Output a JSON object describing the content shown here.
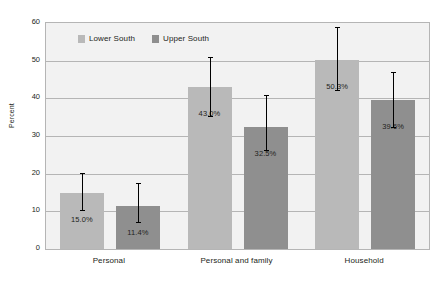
{
  "chart_data": {
    "type": "bar",
    "title": "",
    "xlabel": "",
    "ylabel": "Percent",
    "ylim": [
      0,
      60
    ],
    "yticks": [
      0,
      10,
      20,
      30,
      40,
      50,
      60
    ],
    "grid": true,
    "legend_position": "top-left-inside",
    "categories": [
      "Personal",
      "Personal and family",
      "Household"
    ],
    "series": [
      {
        "name": "Lower South",
        "color": "#b9b9b9",
        "values": [
          15.0,
          43.0,
          50.3
        ],
        "labels": [
          "15.0%",
          "43.0%",
          "50.3%"
        ],
        "error_low": [
          10.0,
          35.0,
          42.0
        ],
        "error_high": [
          20.2,
          51.0,
          59.0
        ]
      },
      {
        "name": "Upper South",
        "color": "#8f8f8f",
        "values": [
          11.4,
          32.5,
          39.6
        ],
        "labels": [
          "11.4%",
          "32.5%",
          "39.6%"
        ],
        "error_low": [
          7.0,
          26.0,
          32.0
        ],
        "error_high": [
          17.5,
          41.0,
          47.0
        ]
      }
    ]
  },
  "legend": {
    "items": [
      {
        "label": "Lower South",
        "color": "#b9b9b9"
      },
      {
        "label": "Upper South",
        "color": "#8f8f8f"
      }
    ]
  },
  "axis": {
    "y_title": "Percent",
    "tick_labels": [
      "60",
      "50",
      "40",
      "30",
      "20",
      "10",
      "0"
    ]
  }
}
